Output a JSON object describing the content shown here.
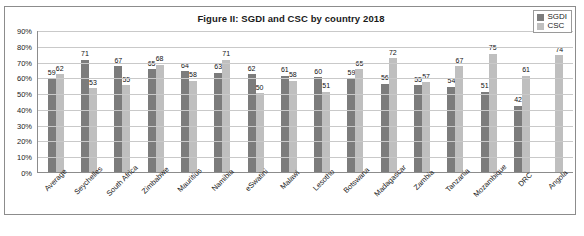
{
  "chart_data": {
    "type": "bar",
    "title": "Figure II: SGDI and CSC by country 2018",
    "xlabel": "",
    "ylabel": "",
    "ylim": [
      0,
      90
    ],
    "grid": true,
    "legend_position": "top-right",
    "ytick_labels": [
      "0%",
      "10%",
      "20%",
      "30%",
      "40%",
      "50%",
      "60%",
      "70%",
      "80%",
      "90%"
    ],
    "ytick_values": [
      0,
      10,
      20,
      30,
      40,
      50,
      60,
      70,
      80,
      90
    ],
    "categories": [
      "Average",
      "Seychelles",
      "South Africa",
      "Zimbabwe",
      "Mauritius",
      "Namibia",
      "eSwatini",
      "Malawi",
      "Lesotho",
      "Botswana",
      "Madagascar",
      "Zambia",
      "Tanzania",
      "Mozambique",
      "DRC",
      "Angola"
    ],
    "series": [
      {
        "name": "SGDI",
        "color": "#7c7c7c",
        "values": [
          59,
          71,
          67,
          65,
          64,
          63,
          62,
          61,
          60,
          59,
          56,
          55,
          54,
          51,
          42,
          null
        ]
      },
      {
        "name": "CSC",
        "color": "#bfbfbf",
        "values": [
          62,
          53,
          55,
          68,
          58,
          71,
          50,
          58,
          51,
          65,
          72,
          57,
          67,
          75,
          61,
          74
        ]
      }
    ]
  },
  "legend": {
    "items": [
      {
        "label": "SGDI",
        "color": "#7c7c7c"
      },
      {
        "label": "CSC",
        "color": "#bfbfbf"
      }
    ]
  },
  "source": {
    "text": ""
  }
}
